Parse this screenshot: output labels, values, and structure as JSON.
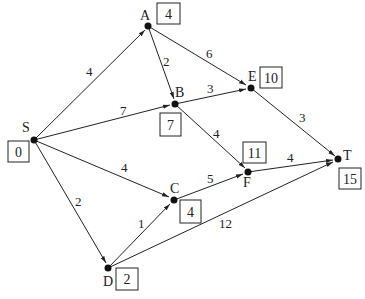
{
  "diagram": {
    "type": "weighted directed graph (shortest path / Dijkstra)",
    "nodes": [
      {
        "id": "S",
        "label": "S",
        "value": "0"
      },
      {
        "id": "A",
        "label": "A",
        "value": "4"
      },
      {
        "id": "B",
        "label": "B",
        "value": "7"
      },
      {
        "id": "E",
        "label": "E",
        "value": "10"
      },
      {
        "id": "C",
        "label": "C",
        "value": "4"
      },
      {
        "id": "F",
        "label": "F",
        "value": "11"
      },
      {
        "id": "T",
        "label": "T",
        "value": "15"
      },
      {
        "id": "D",
        "label": "D",
        "value": "2"
      }
    ],
    "edges": [
      {
        "from": "S",
        "to": "A",
        "weight": "4"
      },
      {
        "from": "S",
        "to": "B",
        "weight": "7"
      },
      {
        "from": "S",
        "to": "C",
        "weight": "4"
      },
      {
        "from": "S",
        "to": "D",
        "weight": "2"
      },
      {
        "from": "A",
        "to": "B",
        "weight": "2"
      },
      {
        "from": "A",
        "to": "E",
        "weight": "6"
      },
      {
        "from": "B",
        "to": "E",
        "weight": "3"
      },
      {
        "from": "B",
        "to": "F",
        "weight": "4"
      },
      {
        "from": "E",
        "to": "T",
        "weight": "3"
      },
      {
        "from": "C",
        "to": "F",
        "weight": "5"
      },
      {
        "from": "F",
        "to": "T",
        "weight": "4"
      },
      {
        "from": "D",
        "to": "C",
        "weight": "1"
      },
      {
        "from": "D",
        "to": "T",
        "weight": "12"
      }
    ]
  }
}
